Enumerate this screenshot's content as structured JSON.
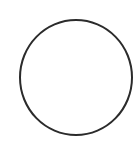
{
  "shape": {
    "type": "circle",
    "stroke_color": "#2b2b2b",
    "fill_color": "#ffffff"
  },
  "background_color": "#ffffff"
}
